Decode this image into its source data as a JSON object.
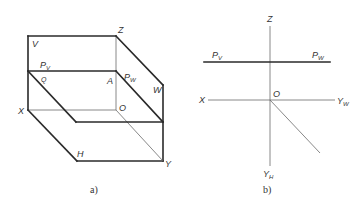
{
  "figure_a": {
    "caption": "a)",
    "labels": {
      "Z": "Z",
      "V": "V",
      "Pv_main": "P",
      "Pv_sub": "V",
      "Q": "Q",
      "A": "A",
      "Pw_main": "P",
      "Pw_sub": "W",
      "W": "W",
      "X": "X",
      "O": "O",
      "H": "H",
      "Y": "Y"
    }
  },
  "figure_b": {
    "caption": "b)",
    "labels": {
      "Z": "Z",
      "Pv_main": "P",
      "Pv_sub": "V",
      "Pw_main": "P",
      "Pw_sub": "W",
      "X": "X",
      "O": "O",
      "Yw_main": "Y",
      "Yw_sub": "W",
      "Yh_main": "Y",
      "Yh_sub": "H"
    }
  }
}
